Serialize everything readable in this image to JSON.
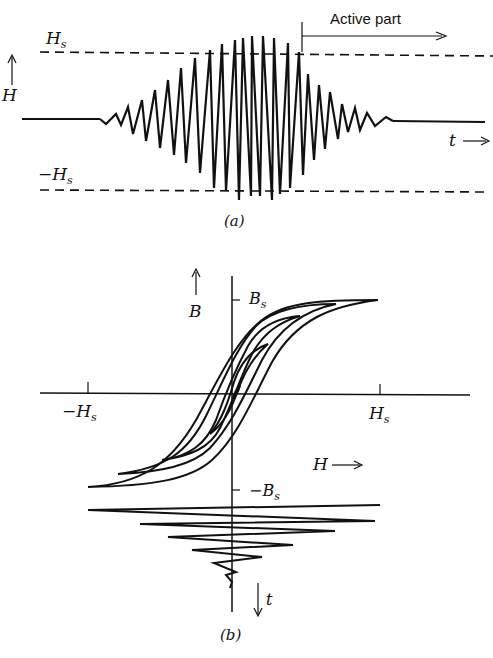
{
  "panel_a": {
    "caption": "(a)",
    "y_axis_label": "H",
    "upper_level_label": "H",
    "upper_level_sub": "s",
    "lower_level_label": "−H",
    "lower_level_sub": "s",
    "time_label": "t",
    "active_part_label": "Active part"
  },
  "panel_b": {
    "caption": "(b)",
    "b_axis_label": "B",
    "bs_label": "B",
    "bs_sub": "s",
    "neg_bs_label": "−B",
    "neg_bs_sub": "s",
    "neg_hs_label": "−H",
    "neg_hs_sub": "s",
    "hs_label": "H",
    "hs_sub": "s",
    "h_axis_label": "H",
    "t_axis_label": "t"
  },
  "colors": {
    "ink": "#111111",
    "background": "#ffffff"
  }
}
